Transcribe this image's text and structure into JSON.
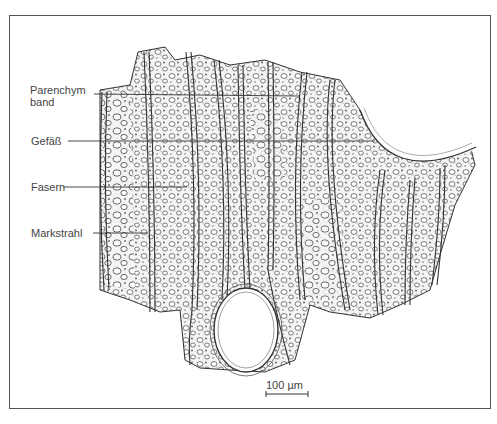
{
  "figure": {
    "type": "botanical-cross-section-illustration",
    "labels": [
      {
        "id": "parenchymband",
        "line1": "Parenchym",
        "line2": "band"
      },
      {
        "id": "gefaess",
        "line1": "Gefäß"
      },
      {
        "id": "fasern",
        "line1": "Fasern"
      },
      {
        "id": "markstrahl",
        "line1": "Markstrahl"
      }
    ],
    "scale_bar": {
      "label": "100 µm"
    },
    "colors": {
      "ink": "#333333",
      "frame": "#555555",
      "background": "#ffffff"
    }
  }
}
